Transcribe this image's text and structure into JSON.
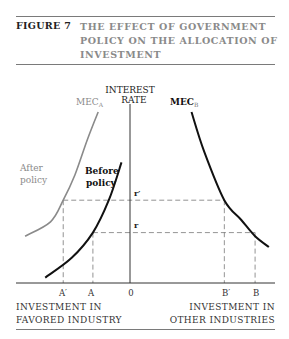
{
  "figure": {
    "label": "FIGURE 7",
    "title_lines": [
      "THE EFFECT OF GOVERNMENT",
      "POLICY ON THE ALLOCATION OF",
      "INVESTMENT"
    ]
  },
  "chart_data": {
    "type": "line",
    "title": "THE EFFECT OF GOVERNMENT POLICY ON THE ALLOCATION OF INVESTMENT",
    "ylabel": [
      "INTEREST",
      "RATE"
    ],
    "xlabel_left": [
      "INVESTMENT IN",
      "FAVORED INDUSTRY"
    ],
    "xlabel_right": [
      "INVESTMENT IN",
      "OTHER INDUSTRIES"
    ],
    "origin_label": "0",
    "x_tick_labels": {
      "A_prime": "A′",
      "A": "A",
      "B_prime": "B′",
      "B": "B"
    },
    "y_tick_labels": {
      "r_prime": "r′",
      "r": "r"
    },
    "note": "Back-to-back diagram: investment in favored industry increases leftward from 0, investment in other industries increases rightward from 0. Values in arbitrary units.",
    "x_range": [
      -11,
      11
    ],
    "y_range": [
      0,
      10
    ],
    "levels": {
      "r_prime": 4.6,
      "r": 2.8
    },
    "points": {
      "A_prime": -6.3,
      "A": -3.5,
      "B_prime": 8.9,
      "B": 11.8
    },
    "series": [
      {
        "name": "MEC_A (After policy)",
        "label_main": "MEC",
        "label_sub": "A",
        "color": "#8a8a8a",
        "x": [
          -3.0,
          -4.0,
          -5.2,
          -6.3,
          -7.5,
          -9.9
        ],
        "y": [
          9.5,
          8.0,
          6.0,
          4.6,
          3.4,
          2.6
        ]
      },
      {
        "name": "Before policy",
        "color": "#111111",
        "x": [
          -0.8,
          -2.0,
          -3.5,
          -5.5,
          -8.0
        ],
        "y": [
          6.7,
          4.6,
          2.8,
          1.4,
          0.3
        ]
      },
      {
        "name": "MEC_B",
        "label_main": "MEC",
        "label_sub": "B",
        "color": "#111111",
        "x": [
          5.8,
          7.0,
          8.9,
          10.5,
          11.8,
          13.1
        ],
        "y": [
          9.5,
          7.3,
          4.6,
          3.5,
          2.6,
          2.0
        ]
      }
    ],
    "annotations": {
      "after_policy": [
        "After",
        "policy"
      ],
      "before_policy": [
        "Before",
        "policy"
      ]
    }
  }
}
